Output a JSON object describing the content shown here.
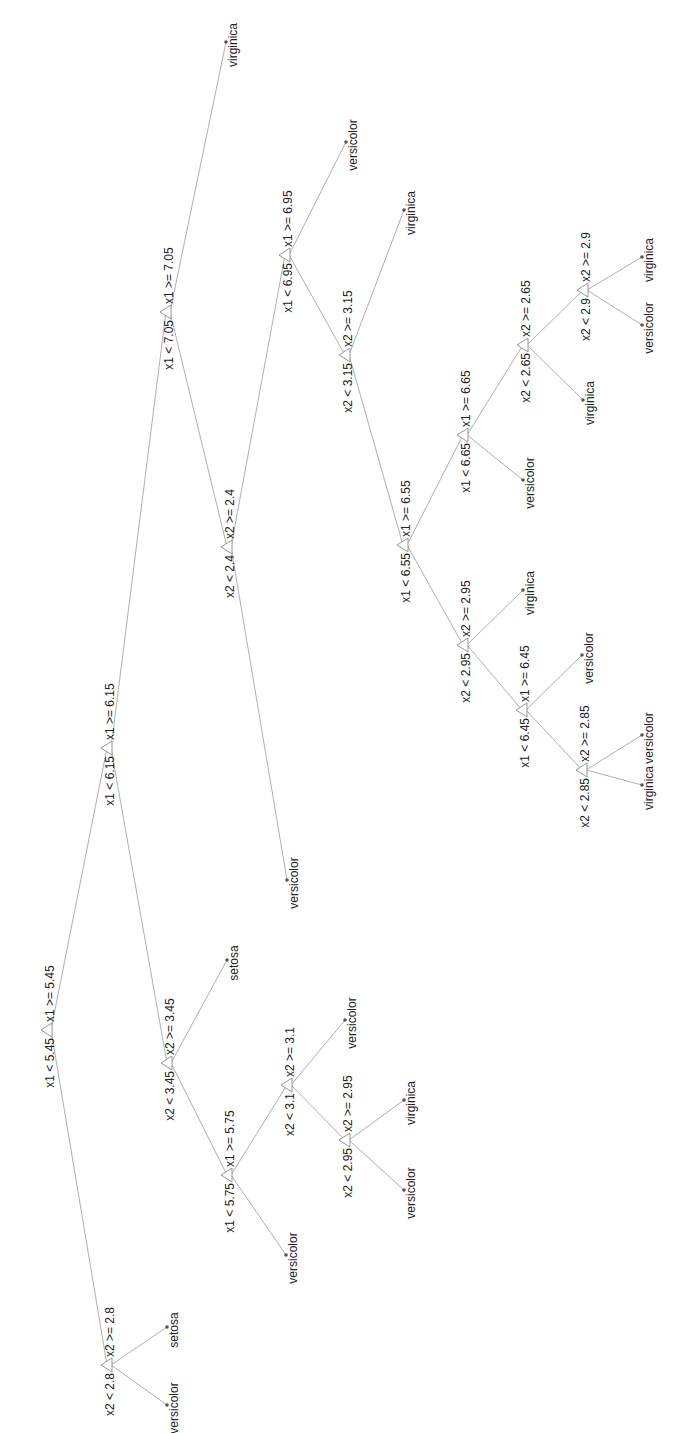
{
  "diagram": {
    "type": "classification-tree",
    "orientation": "rotated-90-ccw",
    "colors": {
      "edge": "#9a9a9a",
      "node": "#8a8a8a",
      "text": "#222222",
      "leaf_dot": "#555555",
      "background": "#ffffff"
    },
    "nodes": [
      {
        "id": "n1",
        "x": 47,
        "y": 1030,
        "left": "x1 < 5.45",
        "right": "x1 >= 5.45"
      },
      {
        "id": "n2",
        "x": 107,
        "y": 1365,
        "left": "x2 < 2.8",
        "right": "x2 >= 2.8"
      },
      {
        "id": "n3",
        "x": 107,
        "y": 748,
        "left": "x1 < 6.15",
        "right": "x1 >= 6.15"
      },
      {
        "id": "n4",
        "x": 167,
        "y": 1063,
        "left": "x2 < 3.45",
        "right": "x2 >= 3.45"
      },
      {
        "id": "n5",
        "x": 166,
        "y": 312,
        "left": "x1 < 7.05",
        "right": "x1 >= 7.05"
      },
      {
        "id": "n6",
        "x": 227,
        "y": 1175,
        "left": "x1 < 5.75",
        "right": "x1 >= 5.75"
      },
      {
        "id": "n7",
        "x": 227,
        "y": 547,
        "left": "x2 < 2.4",
        "right": "x2 >= 2.4"
      },
      {
        "id": "n8",
        "x": 287,
        "y": 1085,
        "left": "x2 < 3.1",
        "right": "x2 >= 3.1"
      },
      {
        "id": "n9",
        "x": 285,
        "y": 255,
        "left": "x1 < 6.95",
        "right": "x1 >= 6.95"
      },
      {
        "id": "n10",
        "x": 345,
        "y": 1140,
        "left": "x2 < 2.95",
        "right": "x2 >= 2.95"
      },
      {
        "id": "n11",
        "x": 345,
        "y": 355,
        "left": "x2 < 3.15",
        "right": "x2 >= 3.15"
      },
      {
        "id": "n12",
        "x": 403,
        "y": 545,
        "left": "x1 < 6.55",
        "right": "x1 >= 6.55"
      },
      {
        "id": "n13",
        "x": 463,
        "y": 645,
        "left": "x2 < 2.95",
        "right": "x2 >= 2.95"
      },
      {
        "id": "n14",
        "x": 463,
        "y": 435,
        "left": "x1 < 6.65",
        "right": "x1 >= 6.65"
      },
      {
        "id": "n15",
        "x": 522,
        "y": 710,
        "left": "x1 < 6.45",
        "right": "x1 >= 6.45"
      },
      {
        "id": "n16",
        "x": 523,
        "y": 345,
        "left": "x2 < 2.65",
        "right": "x2 >= 2.65"
      },
      {
        "id": "n17",
        "x": 582,
        "y": 770,
        "left": "x2 < 2.85",
        "right": "x2 >= 2.85"
      },
      {
        "id": "n18",
        "x": 583,
        "y": 290,
        "left": "x2 < 2.9",
        "right": "x2 >= 2.9"
      }
    ],
    "leaves": [
      {
        "id": "l1",
        "x": 167,
        "y": 1405,
        "label": "versicolor"
      },
      {
        "id": "l2",
        "x": 167,
        "y": 1327,
        "label": "setosa"
      },
      {
        "id": "l3",
        "x": 227,
        "y": 960,
        "label": "setosa"
      },
      {
        "id": "l4",
        "x": 286,
        "y": 1255,
        "label": "versicolor"
      },
      {
        "id": "l5",
        "x": 345,
        "y": 1020,
        "label": "versicolor"
      },
      {
        "id": "l6",
        "x": 404,
        "y": 1190,
        "label": "versicolor"
      },
      {
        "id": "l7",
        "x": 404,
        "y": 1100,
        "label": "virginica"
      },
      {
        "id": "l8",
        "x": 226,
        "y": 42,
        "label": "virginica"
      },
      {
        "id": "l9",
        "x": 287,
        "y": 880,
        "label": "versicolor"
      },
      {
        "id": "l10",
        "x": 346,
        "y": 142,
        "label": "versicolor"
      },
      {
        "id": "l11",
        "x": 404,
        "y": 210,
        "label": "virginica"
      },
      {
        "id": "l12",
        "x": 523,
        "y": 590,
        "label": "virginica"
      },
      {
        "id": "l13",
        "x": 523,
        "y": 480,
        "label": "versicolor"
      },
      {
        "id": "l14",
        "x": 583,
        "y": 400,
        "label": "virginica"
      },
      {
        "id": "l15",
        "x": 642,
        "y": 325,
        "label": "versicolor"
      },
      {
        "id": "l16",
        "x": 642,
        "y": 257,
        "label": "virginica"
      },
      {
        "id": "l17",
        "x": 582,
        "y": 655,
        "label": "versicolor"
      },
      {
        "id": "l18",
        "x": 642,
        "y": 785,
        "label": "virginica"
      },
      {
        "id": "l19",
        "x": 642,
        "y": 735,
        "label": "versicolor"
      }
    ],
    "edges": [
      [
        "n1",
        "n2"
      ],
      [
        "n1",
        "n3"
      ],
      [
        "n2",
        "l1"
      ],
      [
        "n2",
        "l2"
      ],
      [
        "n3",
        "n4"
      ],
      [
        "n3",
        "n5"
      ],
      [
        "n4",
        "n6"
      ],
      [
        "n4",
        "l3"
      ],
      [
        "n6",
        "l4"
      ],
      [
        "n6",
        "n8"
      ],
      [
        "n8",
        "n10"
      ],
      [
        "n8",
        "l5"
      ],
      [
        "n10",
        "l6"
      ],
      [
        "n10",
        "l7"
      ],
      [
        "n5",
        "n7"
      ],
      [
        "n5",
        "l8"
      ],
      [
        "n7",
        "l9"
      ],
      [
        "n7",
        "n9"
      ],
      [
        "n9",
        "n11"
      ],
      [
        "n9",
        "l10"
      ],
      [
        "n11",
        "n12"
      ],
      [
        "n11",
        "l11"
      ],
      [
        "n12",
        "n13"
      ],
      [
        "n12",
        "n14"
      ],
      [
        "n13",
        "n15"
      ],
      [
        "n13",
        "l12"
      ],
      [
        "n15",
        "n17"
      ],
      [
        "n15",
        "l17"
      ],
      [
        "n17",
        "l18"
      ],
      [
        "n17",
        "l19"
      ],
      [
        "n14",
        "l13"
      ],
      [
        "n14",
        "n16"
      ],
      [
        "n16",
        "l14"
      ],
      [
        "n16",
        "n18"
      ],
      [
        "n18",
        "l15"
      ],
      [
        "n18",
        "l16"
      ]
    ]
  }
}
